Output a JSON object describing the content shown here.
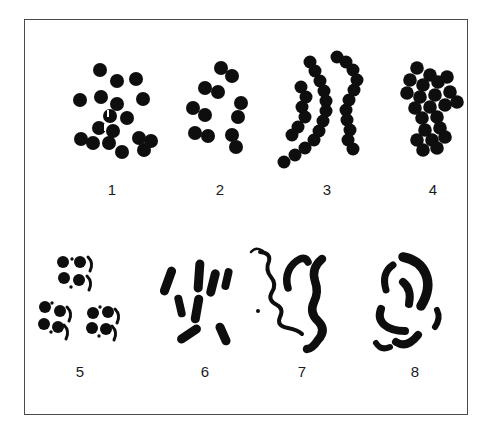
{
  "figure": {
    "width": 491,
    "height": 428,
    "background": "#ffffff",
    "ink": "#0e0e0e",
    "border_color": "#4a4a4a",
    "frame": {
      "x": 24,
      "y": 19,
      "w": 444,
      "h": 396
    },
    "groups": [
      {
        "name": "cocci-irregular-cluster",
        "label": "1",
        "label_x": 112,
        "label_y": 189,
        "r": 7,
        "circles": [
          [
            100,
            70
          ],
          [
            117,
            81
          ],
          [
            136,
            79
          ],
          [
            80,
            100
          ],
          [
            101,
            97
          ],
          [
            143,
            99
          ],
          [
            117,
            104
          ],
          [
            110,
            116
          ],
          [
            127,
            118
          ],
          [
            99,
            128
          ],
          [
            113,
            131
          ],
          [
            81,
            139
          ],
          [
            93,
            143
          ],
          [
            109,
            143
          ],
          [
            139,
            138
          ],
          [
            151,
            141
          ],
          [
            144,
            150
          ],
          [
            122,
            152
          ]
        ],
        "shapes": [
          {
            "t": "w",
            "x": 107,
            "y": 110,
            "w": 2,
            "h": 7
          },
          {
            "t": "w",
            "x": 104,
            "y": 124,
            "w": 2,
            "h": 7
          }
        ]
      },
      {
        "name": "diplococci-pairs",
        "label": "2",
        "label_x": 220,
        "label_y": 189,
        "r": 7,
        "circles": [
          [
            221,
            68
          ],
          [
            232,
            76
          ],
          [
            205,
            88
          ],
          [
            218,
            92
          ],
          [
            193,
            108
          ],
          [
            205,
            115
          ],
          [
            241,
            103
          ],
          [
            238,
            117
          ],
          [
            195,
            133
          ],
          [
            208,
            136
          ],
          [
            232,
            135
          ],
          [
            236,
            147
          ]
        ],
        "shapes": []
      },
      {
        "name": "streptococci-chains",
        "label": "3",
        "label_x": 327,
        "label_y": 189,
        "r": 6.5,
        "circles": [
          [
            301,
            87
          ],
          [
            306,
            97
          ],
          [
            302,
            107
          ],
          [
            305,
            117
          ],
          [
            298,
            127
          ],
          [
            292,
            135
          ],
          [
            310,
            62
          ],
          [
            315,
            71
          ],
          [
            320,
            81
          ],
          [
            324,
            91
          ],
          [
            326,
            101
          ],
          [
            326,
            111
          ],
          [
            323,
            121
          ],
          [
            319,
            131
          ],
          [
            314,
            140
          ],
          [
            305,
            148
          ],
          [
            295,
            155
          ],
          [
            284,
            162
          ],
          [
            337,
            57
          ],
          [
            346,
            62
          ],
          [
            353,
            70
          ],
          [
            357,
            80
          ],
          [
            354,
            90
          ],
          [
            349,
            100
          ],
          [
            346,
            110
          ],
          [
            347,
            120
          ],
          [
            350,
            130
          ],
          [
            348,
            140
          ],
          [
            353,
            149
          ]
        ],
        "shapes": []
      },
      {
        "name": "packed-cocci-cluster",
        "label": "4",
        "label_x": 433,
        "label_y": 189,
        "r": 6.8,
        "circles": [
          [
            417,
            68
          ],
          [
            430,
            75
          ],
          [
            410,
            80
          ],
          [
            423,
            85
          ],
          [
            438,
            82
          ],
          [
            447,
            77
          ],
          [
            407,
            93
          ],
          [
            420,
            97
          ],
          [
            435,
            95
          ],
          [
            450,
            92
          ],
          [
            415,
            108
          ],
          [
            430,
            107
          ],
          [
            445,
            105
          ],
          [
            457,
            102
          ],
          [
            422,
            118
          ],
          [
            437,
            117
          ],
          [
            425,
            130
          ],
          [
            440,
            128
          ],
          [
            417,
            140
          ],
          [
            432,
            140
          ],
          [
            445,
            137
          ],
          [
            423,
            150
          ],
          [
            437,
            148
          ]
        ],
        "shapes": []
      },
      {
        "name": "cocci-tetrads",
        "label": "5",
        "label_x": 80,
        "label_y": 371,
        "r": 6,
        "circles": [
          [
            63,
            262
          ],
          [
            80,
            262
          ],
          [
            64,
            278
          ],
          [
            79,
            280
          ],
          [
            45,
            307
          ],
          [
            60,
            311
          ],
          [
            44,
            324
          ],
          [
            58,
            327
          ],
          [
            93,
            313
          ],
          [
            108,
            312
          ],
          [
            92,
            328
          ],
          [
            106,
            329
          ]
        ],
        "shapes": [
          {
            "t": "p",
            "d": "M88,257 Q94,263 90,271",
            "w": 3
          },
          {
            "t": "p",
            "d": "M87,276 Q93,282 89,290",
            "w": 3
          },
          {
            "t": "p",
            "d": "M67,307 Q73,313 69,321",
            "w": 3
          },
          {
            "t": "p",
            "d": "M64,325 Q70,331 66,339",
            "w": 3
          },
          {
            "t": "p",
            "d": "M115,309 Q121,315 117,323",
            "w": 3
          },
          {
            "t": "p",
            "d": "M112,326 Q118,332 114,340",
            "w": 3
          },
          {
            "t": "c",
            "x": 72,
            "y": 259,
            "r": 1.7
          },
          {
            "t": "c",
            "x": 71,
            "y": 287,
            "r": 1.7
          },
          {
            "t": "c",
            "x": 52,
            "y": 303,
            "r": 1.7
          },
          {
            "t": "c",
            "x": 51,
            "y": 332,
            "r": 1.7
          },
          {
            "t": "c",
            "x": 100,
            "y": 307,
            "r": 1.7
          },
          {
            "t": "c",
            "x": 99,
            "y": 336,
            "r": 1.7
          }
        ]
      },
      {
        "name": "bacilli-rods",
        "label": "6",
        "label_x": 205,
        "label_y": 371,
        "r": 0,
        "circles": [],
        "shapes": [
          {
            "t": "rod",
            "x": 168,
            "y": 281,
            "len": 30,
            "w": 9,
            "a": 20
          },
          {
            "t": "rod",
            "x": 180,
            "y": 306,
            "len": 23,
            "w": 8,
            "a": -13
          },
          {
            "t": "rod",
            "x": 199,
            "y": 276,
            "len": 33,
            "w": 9,
            "a": 4
          },
          {
            "t": "rod",
            "x": 197,
            "y": 309,
            "len": 29,
            "w": 9,
            "a": 10
          },
          {
            "t": "rod",
            "x": 213,
            "y": 283,
            "len": 28,
            "w": 9,
            "a": 14
          },
          {
            "t": "rod",
            "x": 227,
            "y": 279,
            "len": 22,
            "w": 8,
            "a": 13
          },
          {
            "t": "rod",
            "x": 189,
            "y": 334,
            "len": 27,
            "w": 9,
            "a": 56
          },
          {
            "t": "rod",
            "x": 223,
            "y": 334,
            "len": 24,
            "w": 9,
            "a": -24
          },
          {
            "t": "p",
            "d": "M251,252 Q256,246 263,251",
            "w": 2.5
          },
          {
            "t": "c",
            "x": 258,
            "y": 311,
            "r": 2
          }
        ]
      },
      {
        "name": "spirilla-wavy-forms",
        "label": "7",
        "label_x": 302,
        "label_y": 371,
        "r": 0,
        "circles": [],
        "shapes": [
          {
            "t": "p",
            "d": "M260,252 Q271,253 269,261 Q265,270 271,277 Q277,284 272,292 Q267,300 277,305 Q284,309 280,317 Q276,326 288,328 Q298,330 302,334",
            "w": 4
          },
          {
            "t": "p",
            "d": "M288,288 C284,275 290,264 300,259 Q306,257 308,262",
            "w": 7.5
          },
          {
            "t": "p",
            "d": "M322,259 Q311,268 315,281 Q319,292 314,302 Q309,313 318,321 Q327,330 318,340 Q312,349 307,349",
            "w": 8.5
          }
        ]
      },
      {
        "name": "vibrios-curved-rods",
        "label": "8",
        "label_x": 415,
        "label_y": 371,
        "r": 0,
        "circles": [],
        "shapes": [
          {
            "t": "p",
            "d": "M403,257 C424,261 436,281 421,306",
            "w": 9.5
          },
          {
            "t": "p",
            "d": "M393,265 Q381,273 386,290",
            "w": 7
          },
          {
            "t": "p",
            "d": "M403,282 Q412,289 409,304",
            "w": 8
          },
          {
            "t": "p",
            "d": "M381,309 C376,322 387,331 405,331",
            "w": 8
          },
          {
            "t": "p",
            "d": "M396,342 Q407,349 418,335",
            "w": 8
          },
          {
            "t": "p",
            "d": "M437,310 Q441,318 435,327",
            "w": 6
          },
          {
            "t": "p",
            "d": "M376,343 Q381,351 390,347",
            "w": 6
          }
        ]
      }
    ]
  }
}
